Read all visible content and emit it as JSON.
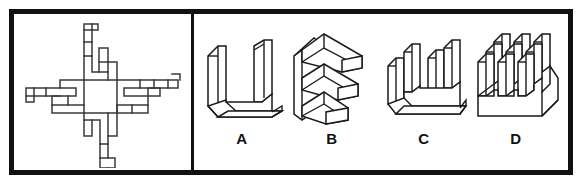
{
  "puzzle": {
    "type": "spatial-folding-puzzle",
    "prompt_panel_label": "unfolded-net",
    "background_color": "#ffffff",
    "frame_color": "#111111",
    "line_color": "#1a1a1a"
  },
  "net": {
    "name": "flat-pattern-net",
    "description": "cross shaped flat pattern with central square and four finned arms",
    "center_shape": "square",
    "arm_count": 4,
    "arm_directions": [
      "up",
      "down",
      "left",
      "right"
    ]
  },
  "options": [
    {
      "id": "A",
      "label": "A",
      "name": "option-a",
      "shape": "u-channel",
      "description": "open U shaped trough with two tall side walls"
    },
    {
      "id": "B",
      "label": "B",
      "name": "option-b",
      "shape": "comb-e-shape",
      "description": "vertical back plate with three horizontal arms"
    },
    {
      "id": "C",
      "label": "C",
      "name": "option-c",
      "shape": "u-base-with-prongs",
      "description": "U shaped base with four vertical prongs"
    },
    {
      "id": "D",
      "label": "D",
      "name": "option-d",
      "shape": "pin-fin-array",
      "description": "rectangular base with a three by three array of square pins"
    }
  ]
}
